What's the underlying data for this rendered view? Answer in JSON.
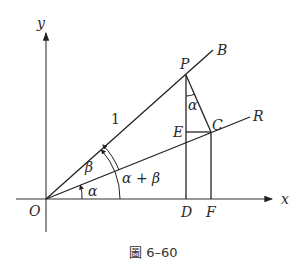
{
  "figure": {
    "caption": "圖 6–60",
    "axes": {
      "x_label": "x",
      "y_label": "y",
      "origin_label": "O"
    },
    "points": {
      "P": "P",
      "B": "B",
      "C": "C",
      "R": "R",
      "E": "E",
      "D": "D",
      "F": "F"
    },
    "segment_labels": {
      "OP": "1"
    },
    "angle_labels": {
      "alpha": "α",
      "beta": "β",
      "alpha_plus_beta": "α + β",
      "angle_at_P": "α"
    },
    "colors": {
      "line": "#222222",
      "background": "#ffffff"
    }
  }
}
